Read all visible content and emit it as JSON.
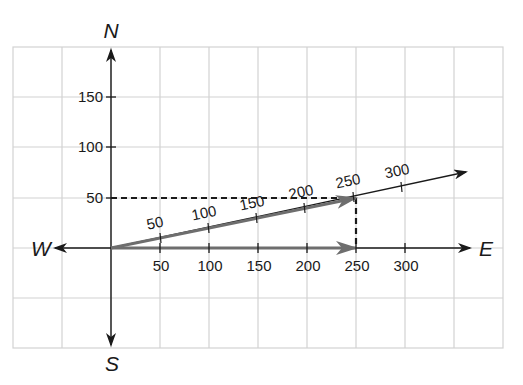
{
  "diagram": {
    "type": "vector-addition-compass",
    "directions": {
      "north": "N",
      "south": "S",
      "east": "E",
      "west": "W"
    },
    "colors": {
      "grid": "#d2d2d2",
      "axis": "#1a1a1a",
      "vector": "#6e6e6e",
      "dashed": "#1a1a1a",
      "background": "#ffffff"
    },
    "y_axis_ticks": [
      "50",
      "100",
      "150"
    ],
    "x_axis_ticks": [
      "50",
      "100",
      "150",
      "200",
      "250",
      "300"
    ],
    "resultant_ticks": [
      "50",
      "100",
      "150",
      "200",
      "250",
      "300"
    ],
    "vectors": [
      {
        "name": "east-component",
        "from": [
          0,
          0
        ],
        "to": [
          250,
          0
        ]
      },
      {
        "name": "resultant",
        "from": [
          0,
          0
        ],
        "to": [
          250,
          50
        ]
      }
    ],
    "dashed_guides": [
      {
        "from": [
          0,
          50
        ],
        "to": [
          250,
          50
        ]
      },
      {
        "from": [
          250,
          50
        ],
        "to": [
          250,
          0
        ]
      }
    ]
  }
}
